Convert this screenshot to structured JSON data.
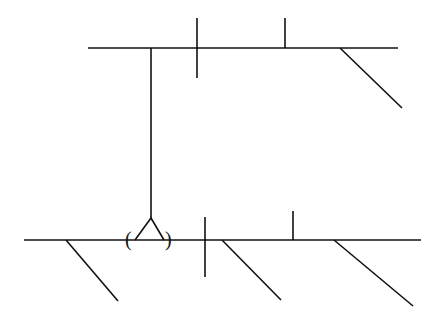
{
  "diagram": {
    "type": "sentence-diagram",
    "stroke_color": "#111111",
    "background": "#ffffff",
    "upper_clause": {
      "baseline": {
        "x1": 88,
        "y1": 48,
        "x2": 398,
        "y2": 48
      },
      "subject_predicate_divider": {
        "x1": 197,
        "y1": 18,
        "x2": 197,
        "y2": 78
      },
      "predicate_object_divider": {
        "x1": 285,
        "y1": 18,
        "x2": 285,
        "y2": 48
      },
      "modifiers": [
        {
          "x1": 340,
          "y1": 48,
          "x2": 402,
          "y2": 108
        }
      ]
    },
    "connector": {
      "x1": 151,
      "y1": 48,
      "x2": 151,
      "y2": 218
    },
    "fork": {
      "apex": [
        151,
        218
      ],
      "left": [
        135,
        240
      ],
      "right": [
        164,
        240
      ]
    },
    "parentheses": {
      "open": "(",
      "close": ")"
    },
    "lower_clause": {
      "baseline": {
        "x1": 24,
        "y1": 240,
        "x2": 421,
        "y2": 240
      },
      "subject_predicate_divider": {
        "x1": 205,
        "y1": 217,
        "x2": 205,
        "y2": 277
      },
      "predicate_object_divider": {
        "x1": 293,
        "y1": 211,
        "x2": 293,
        "y2": 240
      },
      "modifiers": [
        {
          "x1": 66,
          "y1": 240,
          "x2": 118,
          "y2": 301
        },
        {
          "x1": 222,
          "y1": 240,
          "x2": 281,
          "y2": 300
        },
        {
          "x1": 334,
          "y1": 240,
          "x2": 413,
          "y2": 306
        }
      ]
    }
  }
}
